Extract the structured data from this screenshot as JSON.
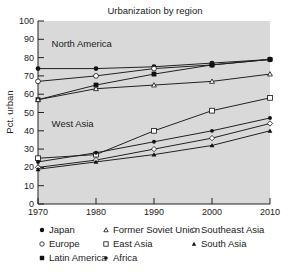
{
  "chart_data": {
    "type": "line",
    "title": "Urbanization by region",
    "xlabel": "",
    "ylabel": "Pct. urban",
    "x": [
      1970,
      1980,
      1990,
      2000,
      2010
    ],
    "xticks": [
      "1970",
      "1980",
      "1990",
      "2000",
      "2010"
    ],
    "yticks": [
      "0",
      "10",
      "20",
      "30",
      "40",
      "50",
      "60",
      "70",
      "80",
      "90",
      "100"
    ],
    "ylim": [
      0,
      100
    ],
    "xlim": [
      1970,
      2010
    ],
    "grid": false,
    "background": "#d9d9d9",
    "annotations": [
      {
        "text": "North America",
        "x": 1972,
        "y": 86
      },
      {
        "text": "West Asia",
        "x": 1972,
        "y": 42
      }
    ],
    "series": [
      {
        "name": "Japan",
        "marker": "filled-circle",
        "values": [
          74,
          74,
          75,
          77,
          79
        ]
      },
      {
        "name": "Europe",
        "marker": "open-circle",
        "values": [
          67,
          70,
          74,
          76,
          79
        ]
      },
      {
        "name": "Latin America",
        "marker": "filled-square",
        "values": [
          57,
          65,
          71,
          76,
          79
        ]
      },
      {
        "name": "Former Soviet Union",
        "marker": "open-triangle",
        "values": [
          57,
          63,
          65,
          67,
          71
        ]
      },
      {
        "name": "East Asia",
        "marker": "open-square",
        "values": [
          25,
          27,
          40,
          51,
          58
        ]
      },
      {
        "name": "Africa",
        "marker": "filled-small-circle",
        "values": [
          23,
          28,
          34,
          40,
          47
        ]
      },
      {
        "name": "Southeast Asia",
        "marker": "open-diamond",
        "values": [
          20,
          24,
          30,
          36,
          44
        ]
      },
      {
        "name": "South Asia",
        "marker": "filled-triangle",
        "values": [
          19,
          23,
          27,
          32,
          40
        ]
      }
    ],
    "legend_position": "bottom"
  },
  "legend": [
    {
      "label": "Japan",
      "marker": "filled-circle",
      "col": 0,
      "row": 0
    },
    {
      "label": "Former Soviet Union",
      "marker": "open-triangle",
      "col": 1,
      "row": 0
    },
    {
      "label": "Southeast Asia",
      "marker": "open-diamond",
      "col": 2,
      "row": 0
    },
    {
      "label": "Europe",
      "marker": "open-circle",
      "col": 0,
      "row": 1
    },
    {
      "label": "East Asia",
      "marker": "open-square",
      "col": 1,
      "row": 1
    },
    {
      "label": "South Asia",
      "marker": "filled-triangle",
      "col": 2,
      "row": 1
    },
    {
      "label": "Latin America",
      "marker": "filled-square",
      "col": 0,
      "row": 2
    },
    {
      "label": "Africa",
      "marker": "filled-small-circle",
      "col": 1,
      "row": 2
    }
  ]
}
